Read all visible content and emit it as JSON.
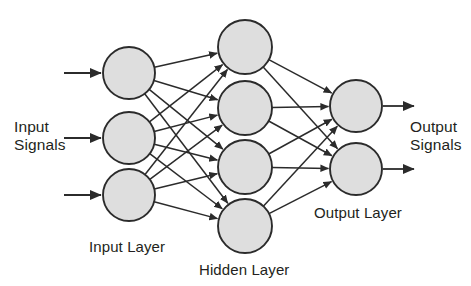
{
  "diagram": {
    "type": "neural-network",
    "background_color": "#ffffff",
    "node_fill_color": "#dedede",
    "node_stroke_color": "#2b2b2b",
    "edge_color": "#2b2b2b",
    "text_color": "#231f20"
  },
  "labels": {
    "input_signals": "Input\nSignals",
    "output_signals": "Output\nSignals",
    "input_layer": "Input Layer",
    "hidden_layer": "Hidden Layer",
    "output_layer": "Output Layer"
  },
  "layers": [
    {
      "id": "input",
      "name": "Input Layer",
      "node_count": 3,
      "radius": 26,
      "center_x": 129,
      "node_centers_y": [
        73,
        138,
        195
      ]
    },
    {
      "id": "hidden",
      "name": "Hidden Layer",
      "node_count": 4,
      "radius": 27,
      "center_x": 245,
      "node_centers_y": [
        47,
        108,
        167,
        226
      ]
    },
    {
      "id": "output",
      "name": "Output Layer",
      "node_count": 2,
      "radius": 26,
      "center_x": 356,
      "node_centers_y": [
        106,
        169
      ]
    }
  ],
  "connections": [
    {
      "from_layer": "input",
      "to_layer": "hidden",
      "pattern": "fully-connected",
      "edge_count": 12,
      "directed": true
    },
    {
      "from_layer": "hidden",
      "to_layer": "output",
      "pattern": "fully-connected",
      "edge_count": 8,
      "directed": true
    }
  ],
  "io_arrows": {
    "inputs": [
      {
        "x1": 64,
        "y1": 73,
        "x2": 101,
        "y2": 73
      },
      {
        "x1": 64,
        "y1": 138,
        "x2": 101,
        "y2": 138
      },
      {
        "x1": 64,
        "y1": 195,
        "x2": 101,
        "y2": 195
      }
    ],
    "outputs": [
      {
        "x1": 383,
        "y1": 106,
        "x2": 414,
        "y2": 106
      },
      {
        "x1": 383,
        "y1": 169,
        "x2": 414,
        "y2": 169
      }
    ]
  }
}
